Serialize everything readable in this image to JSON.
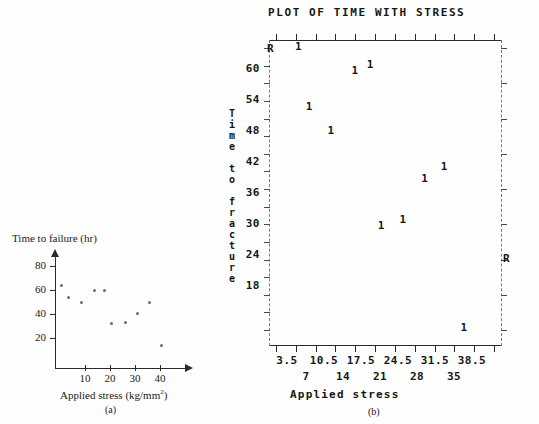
{
  "chart_data": [
    {
      "id": "panel_a",
      "type": "scatter",
      "title": "",
      "caption": "(a)",
      "xlabel": "Applied stress (kg/mm2)",
      "xlabel_base": "Applied stress (kg/mm",
      "xlabel_sup": "2",
      "xlabel_tail": ")",
      "ylabel": "Time to failure (hr)",
      "xticks": [
        10,
        20,
        30,
        40
      ],
      "yticks": [
        20,
        40,
        60,
        80
      ],
      "xlim": [
        0,
        45
      ],
      "ylim": [
        0,
        90
      ],
      "grid": false,
      "legend": "none",
      "x": [
        2.5,
        5,
        10,
        15,
        19,
        21.5,
        27,
        31.5,
        36,
        40.5
      ],
      "y": [
        65,
        55,
        51,
        61,
        61,
        35,
        36,
        43,
        51,
        18
      ]
    },
    {
      "id": "panel_b",
      "type": "scatter",
      "title": "PLOT OF TIME WITH STRESS",
      "caption": "(b)",
      "xlabel": "Applied stress",
      "ylabel": "Time to fracture",
      "ylabel_chars": [
        "T",
        "i",
        "m",
        "e",
        "",
        "t",
        "o",
        "",
        "f",
        "r",
        "a",
        "c",
        "t",
        "u",
        "r",
        "e"
      ],
      "xticks_upper": [
        "3.5",
        "10.5",
        "17.5",
        "24.5",
        "31.5",
        "38.5"
      ],
      "xticks_lower": [
        "7",
        "14",
        "21",
        "28",
        "35"
      ],
      "yticks": [
        "60",
        "54",
        "48",
        "42",
        "36",
        "30",
        "24",
        "18"
      ],
      "xlim": [
        0,
        42
      ],
      "ylim": [
        15,
        66
      ],
      "grid": false,
      "legend": "none",
      "marker_symbol": "1",
      "corner_symbol": "R",
      "corner_markers": [
        {
          "label": "R",
          "position": "top-left"
        },
        {
          "label": "R",
          "position": "right-middle"
        }
      ],
      "points": [
        {
          "x": 2.5,
          "y": 65,
          "label": "1"
        },
        {
          "x": 5.0,
          "y": 55,
          "label": "1"
        },
        {
          "x": 10.0,
          "y": 51,
          "label": "1"
        },
        {
          "x": 15.5,
          "y": 61,
          "label": "1"
        },
        {
          "x": 19.0,
          "y": 62,
          "label": "1"
        },
        {
          "x": 21.5,
          "y": 35,
          "label": "1"
        },
        {
          "x": 26.5,
          "y": 36,
          "label": "1"
        },
        {
          "x": 31.5,
          "y": 43,
          "label": "1"
        },
        {
          "x": 36.0,
          "y": 45,
          "label": "1"
        },
        {
          "x": 40.5,
          "y": 18,
          "label": "1"
        }
      ]
    }
  ],
  "panel_a": {
    "ylabel": "Time to failure (hr)",
    "xlabel_base": "Applied stress (kg/mm",
    "xlabel_sup": "2",
    "xlabel_tail": ")",
    "caption": "(a)",
    "ytick_labels": [
      "80",
      "60",
      "40",
      "20"
    ],
    "xtick_labels": [
      "10",
      "20",
      "30",
      "40"
    ]
  },
  "panel_b": {
    "title": "PLOT OF TIME WITH STRESS",
    "xlabel": "Applied stress",
    "caption": "(b)",
    "ytick_labels": [
      "60",
      "54",
      "48",
      "42",
      "36",
      "30",
      "24",
      "18"
    ],
    "xtick_upper_labels": [
      "3.5",
      "10.5",
      "17.5",
      "24.5",
      "31.5",
      "38.5"
    ],
    "xtick_lower_labels": [
      "7",
      "14",
      "21",
      "28",
      "35"
    ],
    "ylabel_chars": [
      "T",
      "i",
      "m",
      "e",
      " ",
      "t",
      "o",
      " ",
      "f",
      "r",
      "a",
      "c",
      "t",
      "u",
      "r",
      "e"
    ],
    "marker": "1",
    "corner_left": "R",
    "corner_right": "R"
  },
  "colors": {
    "background": "#fefefe",
    "ink": "#1a1a1a",
    "axis": "#2a2a2a",
    "dash_axis": "#7c7c7c",
    "marker_a": "#6b6b6b"
  }
}
